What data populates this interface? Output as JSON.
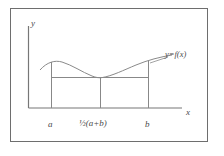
{
  "figure": {
    "name": "graph-of-function-with-ordinates",
    "background_color": "#ffffff",
    "border_color": "#6e6e6e",
    "line_color": "#777777",
    "text_color": "#4a4a4a"
  },
  "axes": {
    "y_axis_label": "y",
    "x_axis_label": "x",
    "origin_px": {
      "x": 28,
      "y": 108
    },
    "y_axis_top_px": 26,
    "x_axis_right_px": 182
  },
  "ticks": [
    {
      "id": "left-endpoint",
      "label": "a",
      "x_px": 51
    },
    {
      "id": "midpoint",
      "label": "½(a+b)",
      "x_px": 100
    },
    {
      "id": "right-endpoint",
      "label": "b",
      "x_px": 148
    }
  ],
  "curve": {
    "label": "y=f(x)",
    "path": "M 40,70 C 47,62 55,60 62,62 C 72,65 82,72 92,76 C 96,77.6 99,78 102,77.6 C 112,76 124,70 136,65 C 148,60 160,57 172,55",
    "description": "smooth curve with a local maximum left of a, a minimum at the midpoint, rising to the right"
  },
  "chord": {
    "description": "horizontal line joining the ordinate feet at the curve minimum level",
    "y_px": 77,
    "x_start_px": 51,
    "x_end_px": 148
  },
  "ordinates": [
    {
      "id": "ordinate-a",
      "x_px": 51,
      "y_top_px": 62,
      "y_bottom_px": 108
    },
    {
      "id": "ordinate-mid",
      "x_px": 100,
      "y_top_px": 77.6,
      "y_bottom_px": 108
    },
    {
      "id": "ordinate-b",
      "x_px": 148,
      "y_top_px": 61,
      "y_bottom_px": 108
    }
  ],
  "border": {
    "x": 10,
    "y": 8,
    "width": 198,
    "height": 134
  }
}
